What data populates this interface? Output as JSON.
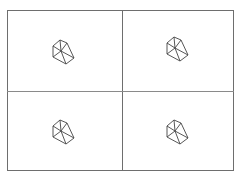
{
  "layout": {
    "rows": 2,
    "cols": 2
  },
  "colors": {
    "border": "#6e6e6e",
    "icon_stroke": "#444444",
    "background": "#ffffff"
  },
  "cells": [
    {
      "icon": "polyhedron-wireframe-icon"
    },
    {
      "icon": "polyhedron-wireframe-icon"
    },
    {
      "icon": "polyhedron-wireframe-icon"
    },
    {
      "icon": "polyhedron-wireframe-icon"
    }
  ]
}
